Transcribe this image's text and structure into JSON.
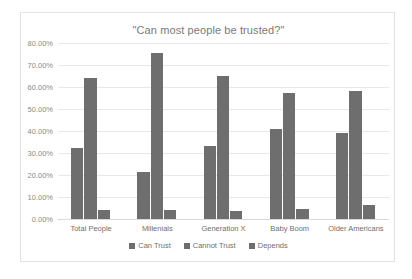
{
  "chart_data": {
    "type": "bar",
    "title": "\"Can most people be trusted?\"",
    "xlabel": "",
    "ylabel": "",
    "ylim": [
      0,
      80
    ],
    "ytick_labels": [
      "80.00%",
      "70.00%",
      "60.00%",
      "50.00%",
      "40.00%",
      "30.00%",
      "20.00%",
      "10.00%",
      "0.00%"
    ],
    "ytick_values": [
      80,
      70,
      60,
      50,
      40,
      30,
      20,
      10,
      0
    ],
    "grid": true,
    "legend_position": "bottom",
    "categories": [
      "Total People",
      "Millenials",
      "Generation X",
      "Baby Boom",
      "Older Americans"
    ],
    "series": [
      {
        "name": "Can Trust",
        "color": "#6e6e6e",
        "values": [
          32.3,
          21.5,
          33.0,
          41.0,
          39.0
        ]
      },
      {
        "name": "Cannot Trust",
        "color": "#6e6e6e",
        "values": [
          64.3,
          75.5,
          65.0,
          57.5,
          58.0
        ]
      },
      {
        "name": "Depends",
        "color": "#6e6e6e",
        "values": [
          4.0,
          4.0,
          3.5,
          4.5,
          6.5
        ]
      }
    ]
  },
  "colors": {
    "bar": "#6e6e6e",
    "gridline": "#e8e8e8",
    "frame_border": "#e2e2e2",
    "title_text": "#7a7a7a",
    "label_text": "#6f6f6f",
    "background": "#ffffff"
  }
}
